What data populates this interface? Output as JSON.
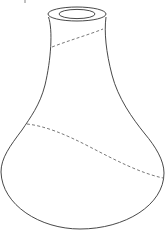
{
  "figure": {
    "line_color": "#333333",
    "dash_color": "#555555",
    "background": "#ffffff",
    "elements": [
      {
        "name": "rim-outer",
        "type": "ellipse"
      },
      {
        "name": "rim-inner",
        "type": "ellipse"
      },
      {
        "name": "vase-outline",
        "type": "path"
      },
      {
        "name": "upper-dashed-section",
        "type": "dashed-curve"
      },
      {
        "name": "lower-dashed-section",
        "type": "dashed-curve"
      }
    ]
  }
}
